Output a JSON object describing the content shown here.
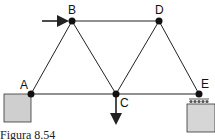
{
  "figure": {
    "caption": "Figura 8.54",
    "type": "truss",
    "nodes": [
      {
        "id": "A",
        "label": "A"
      },
      {
        "id": "B",
        "label": "B"
      },
      {
        "id": "C",
        "label": "C"
      },
      {
        "id": "D",
        "label": "D"
      },
      {
        "id": "E",
        "label": "E"
      }
    ],
    "members": [
      [
        "A",
        "B"
      ],
      [
        "B",
        "C"
      ],
      [
        "B",
        "D"
      ],
      [
        "C",
        "D"
      ],
      [
        "D",
        "E"
      ],
      [
        "A",
        "C"
      ],
      [
        "C",
        "E"
      ]
    ],
    "loads": [
      {
        "node": "B",
        "direction": "horizontal-right"
      },
      {
        "node": "C",
        "direction": "vertical-down"
      }
    ],
    "supports": [
      {
        "node": "A",
        "type": "fixed-pin"
      },
      {
        "node": "E",
        "type": "roller"
      }
    ],
    "colors": {
      "line": "#222222",
      "support_fill": "#cfcfcf"
    }
  }
}
